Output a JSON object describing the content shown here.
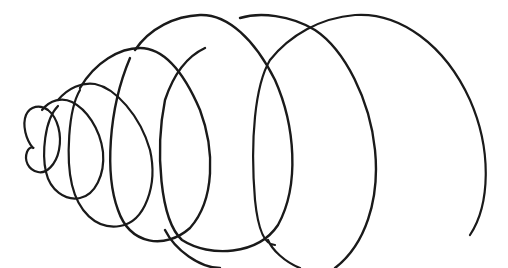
{
  "image": {
    "description": "Hand-drawn line sketch of an expanding spiral coil in perspective",
    "width": 508,
    "height": 268,
    "background": "#ffffff",
    "stroke_color": "#1a1a1a"
  }
}
